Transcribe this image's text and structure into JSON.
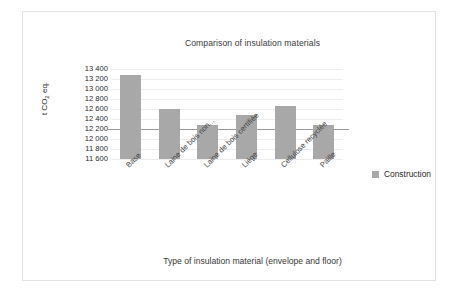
{
  "chart_data": {
    "type": "bar",
    "title": "Comparison of insulation materials",
    "xlabel": "Type of insulation material (envelope and floor)",
    "ylabel": "t CO2 eq.",
    "ylabel_parts": {
      "prefix": "t CO",
      "sub": "2",
      "suffix": " eq."
    },
    "categories": [
      "Base",
      "Laine de bois non...",
      "Laine de bois certifiée",
      "Liège",
      "Cellulose recyclée",
      "Paille"
    ],
    "series": [
      {
        "name": "Construction",
        "values": [
          13290,
          12600,
          12290,
          12480,
          12670,
          12290
        ],
        "color": "#a8a8a8"
      }
    ],
    "ylim": [
      11600,
      13400
    ],
    "ytick_step": 200,
    "yticks": [
      "13 400",
      "13 200",
      "13 000",
      "12 800",
      "12 600",
      "12 400",
      "12 200",
      "12 000",
      "11 800",
      "11 600"
    ],
    "ytick_values": [
      13400,
      13200,
      13000,
      12800,
      12600,
      12400,
      12200,
      12000,
      11800,
      11600
    ],
    "highlight_line": 12200,
    "grid": true,
    "legend_position": "right",
    "legend": [
      {
        "label": "Construction",
        "color": "#a8a8a8"
      }
    ]
  }
}
